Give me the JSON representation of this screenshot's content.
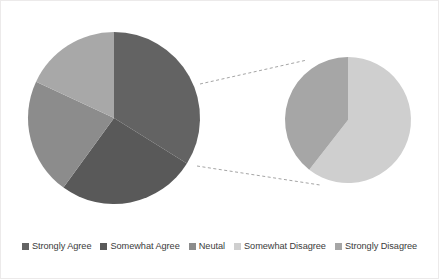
{
  "chart_data": {
    "type": "pie",
    "title": "",
    "subtitle": "",
    "variant": "pie-of-pie",
    "grid": false,
    "legend_position": "bottom",
    "categories": [
      "Strongly Agree",
      "Somewhat Agree",
      "Neutal",
      "Somewhat Disagree",
      "Strongly Disagree"
    ],
    "values": [
      34,
      26,
      22,
      11,
      7
    ],
    "colors": [
      "#636363",
      "#595959",
      "#8c8c8c",
      "#cfcfcf",
      "#a6a6a6"
    ],
    "primary_pie": {
      "name": "Main pie",
      "center_x": 114,
      "center_y": 118,
      "radius": 86,
      "slices": [
        {
          "label": "Strongly Agree",
          "value": 34,
          "color": "#636363",
          "start_deg": 0,
          "end_deg": 122
        },
        {
          "label": "Somewhat Agree",
          "value": 26,
          "color": "#595959",
          "start_deg": 122,
          "end_deg": 216
        },
        {
          "label": "Neutal",
          "value": 22,
          "color": "#8c8c8c",
          "start_deg": 216,
          "end_deg": 295
        },
        {
          "label": "Other",
          "value": 18,
          "color": "#a8a8a8",
          "start_deg": 295,
          "end_deg": 360
        }
      ]
    },
    "secondary_pie": {
      "name": "Exploded detail pie",
      "center_x": 348,
      "center_y": 120,
      "radius": 63,
      "slices": [
        {
          "label": "Somewhat Disagree",
          "value": 11,
          "color": "#cfcfcf",
          "start_deg": 0,
          "end_deg": 218
        },
        {
          "label": "Strongly Disagree",
          "value": 7,
          "color": "#a6a6a6",
          "start_deg": 218,
          "end_deg": 360
        }
      ]
    },
    "connectors": [
      {
        "name": "upper-connector",
        "x1": 200,
        "y1": 84,
        "x2": 307,
        "y2": 60
      },
      {
        "name": "lower-connector",
        "x1": 197,
        "y1": 166,
        "x2": 320,
        "y2": 185
      }
    ]
  },
  "legend": {
    "items": [
      {
        "label": "Strongly Agree",
        "color": "#636363"
      },
      {
        "label": "Somewhat Agree",
        "color": "#595959"
      },
      {
        "label": "Neutal",
        "color": "#8c8c8c"
      },
      {
        "label": "Somewhat Disagree",
        "color": "#cfcfcf"
      },
      {
        "label": "Strongly Disagree",
        "color": "#a6a6a6"
      }
    ]
  }
}
